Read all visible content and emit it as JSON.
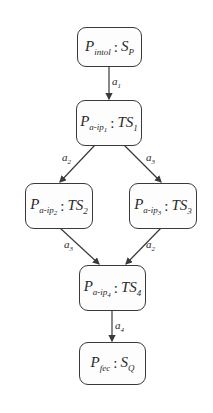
{
  "diagram": {
    "nodes": [
      {
        "id": "n1",
        "process": "P",
        "process_sub": "intol",
        "sep": ":",
        "state": "S",
        "state_sub": "P"
      },
      {
        "id": "n2",
        "process": "P",
        "process_sub": "a-ip",
        "process_sub_idx": "1",
        "sep": ":",
        "state": "TS",
        "state_sub": "1"
      },
      {
        "id": "n3",
        "process": "P",
        "process_sub": "a-ip",
        "process_sub_idx": "2",
        "sep": ":",
        "state": "TS",
        "state_sub": "2"
      },
      {
        "id": "n4",
        "process": "P",
        "process_sub": "a-ip",
        "process_sub_idx": "3",
        "sep": ":",
        "state": "TS",
        "state_sub": "3"
      },
      {
        "id": "n5",
        "process": "P",
        "process_sub": "a-ip",
        "process_sub_idx": "4",
        "sep": ":",
        "state": "TS",
        "state_sub": "4"
      },
      {
        "id": "n6",
        "process": "P",
        "process_sub": "fec",
        "sep": ":",
        "state": "S",
        "state_sub": "Q"
      }
    ],
    "edges": [
      {
        "from": "n1",
        "to": "n2",
        "label": "a",
        "label_sub": "1"
      },
      {
        "from": "n2",
        "to": "n3",
        "label": "a",
        "label_sub": "2"
      },
      {
        "from": "n2",
        "to": "n4",
        "label": "a",
        "label_sub": "3"
      },
      {
        "from": "n3",
        "to": "n5",
        "label": "a",
        "label_sub": "3"
      },
      {
        "from": "n4",
        "to": "n5",
        "label": "a",
        "label_sub": "2"
      },
      {
        "from": "n5",
        "to": "n6",
        "label": "a",
        "label_sub": "4"
      }
    ]
  }
}
